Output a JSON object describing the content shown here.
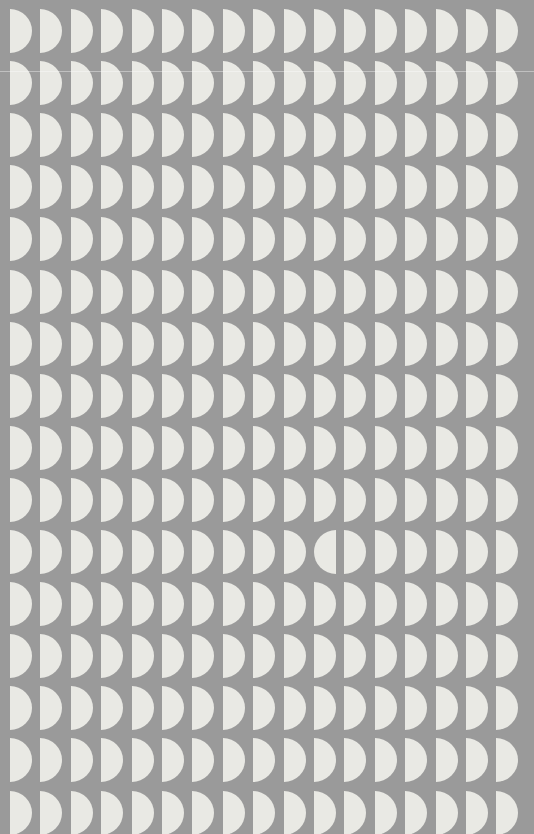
{
  "scene": {
    "title": "Half-Disc Grid Pattern",
    "description": "Repeating grid of light half-disc (semicircle) shapes on a flat gray background, with a single mirrored anomaly",
    "width": 534,
    "height": 834,
    "background_color": "#9a9a9a",
    "shape_color": "#e9e9e4",
    "shape_name": "half-disc"
  },
  "grid": {
    "columns": 17,
    "rows": 16,
    "column_pitch": 30.4,
    "row_pitch": 52.1,
    "origin_x": 10,
    "origin_y": 9,
    "shape_width": 22,
    "shape_height": 44,
    "default_orientation": "orient-right"
  },
  "anomaly": {
    "present": true,
    "label": "mirrored-half-disc",
    "row_index": 10,
    "column_index": 10,
    "row_number_human": "11",
    "column_number_human": "11",
    "orientation": "orient-left",
    "effect": "pairs with the neighbouring right-facing half-disc to read as a full circle split by a thin gap"
  },
  "artifact": {
    "scanline_y": 71,
    "scanline_color": "rgba(255,255,255,0.38)",
    "label": "horizontal-scanline"
  }
}
